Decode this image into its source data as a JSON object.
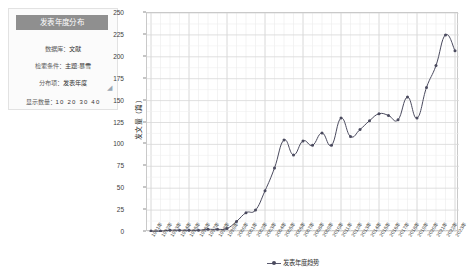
{
  "panel": {
    "title": "发表年度分布",
    "rows": [
      {
        "label": "数据库：",
        "value": "文献"
      },
      {
        "label": "检索条件：",
        "value": "主题:暴雪"
      },
      {
        "label": "分布项：",
        "value": "发表年度"
      }
    ],
    "count_label": "显示数量：",
    "count_options": "10  20  30  40",
    "resize_icon": "resize-corner-icon"
  },
  "chart_data": {
    "type": "line",
    "title": "",
    "xlabel": "",
    "ylabel": "发文量（篇）",
    "legend": "发表年度趋势",
    "legend_position": "bottom",
    "grid": true,
    "ylim": [
      0,
      250
    ],
    "yticks": [
      0,
      25,
      50,
      75,
      100,
      125,
      150,
      175,
      200,
      225,
      250
    ],
    "series_color": "#4a4a5e",
    "categories": [
      "1991年",
      "1992年",
      "1993年",
      "1994年",
      "1995年",
      "1996年",
      "1997年",
      "1998年",
      "1999年",
      "2000年",
      "2001年",
      "2002年",
      "2003年",
      "2004年",
      "2005年",
      "2006年",
      "2007年",
      "2008年",
      "2009年",
      "2010年",
      "2011年",
      "2012年",
      "2013年",
      "2014年",
      "2015年",
      "2016年",
      "2017年",
      "2018年",
      "2019年",
      "2020年",
      "2021年",
      "2022年",
      "2023年"
    ],
    "values": [
      1,
      1,
      2,
      2,
      2,
      2,
      3,
      3,
      4,
      12,
      22,
      25,
      47,
      73,
      105,
      88,
      104,
      99,
      113,
      99,
      130,
      109,
      117,
      127,
      135,
      133,
      128,
      154,
      130,
      165,
      190,
      225,
      207
    ]
  }
}
